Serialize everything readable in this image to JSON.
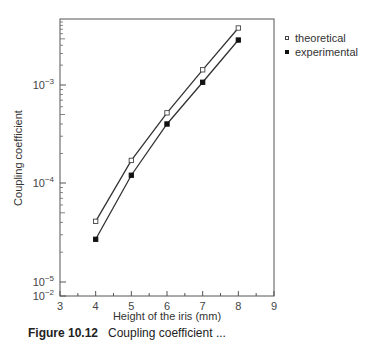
{
  "chart_data": {
    "type": "line",
    "title": "",
    "xlabel": "Height of the iris (mm)",
    "ylabel": "Coupling coefficient",
    "xlim": [
      3,
      9
    ],
    "ylim": [
      1e-05,
      0.01
    ],
    "yscale": "log",
    "x_ticks": [
      "3",
      "4",
      "5",
      "6",
      "7",
      "8",
      "9"
    ],
    "y_ticks": [
      {
        "base": "10",
        "exp": "-2",
        "value": 0.01
      },
      {
        "base": "10",
        "exp": "-3",
        "value": 0.001
      },
      {
        "base": "10",
        "exp": "-4",
        "value": 0.0001
      },
      {
        "base": "10",
        "exp": "-5",
        "value": 1e-05
      }
    ],
    "grid": false,
    "legend_position": "right, outside top",
    "x": [
      4,
      5,
      6,
      7,
      8
    ],
    "series": [
      {
        "name": "theoretical",
        "marker": "open-square",
        "values": [
          4.1e-05,
          0.00017,
          0.00052,
          0.0017,
          0.0073
        ]
      },
      {
        "name": "experimental",
        "marker": "filled-square",
        "values": [
          2.7e-05,
          0.00012,
          0.0004,
          0.0011,
          0.0048
        ]
      }
    ]
  },
  "legend": {
    "items": [
      {
        "label": "theoretical"
      },
      {
        "label": "experimental"
      }
    ]
  },
  "caption": {
    "number": "Figure 10.12",
    "text": "Coupling coefficient ..."
  }
}
